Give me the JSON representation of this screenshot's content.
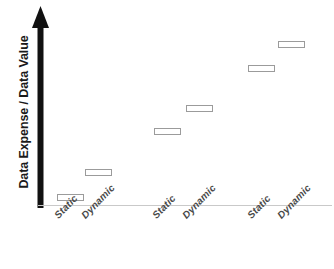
{
  "chart_data": {
    "type": "scatter",
    "title": "",
    "subtitle": "",
    "xlabel": "",
    "ylabel": "Data Expense / Data Value",
    "grid": false,
    "legend": null,
    "marker_style": "hollow-rectangle",
    "axis_style": {
      "y_axis": "thick-black-upward-arrow",
      "x_axis": "thin-light-gray-line",
      "y_ticks": [],
      "x_ticks_rotated_deg": -46
    },
    "note": "Qualitative staircase: six hollow rectangle markers ascending left to right across three groups of Static/Dynamic pairs. No numeric tick labels are printed on either axis.",
    "categories": [
      "Static",
      "Dynamic",
      "Static",
      "Dynamic",
      "Static",
      "Dynamic"
    ],
    "values": [
      1,
      2,
      4,
      5,
      7,
      8
    ],
    "ylim": [
      0,
      9
    ],
    "points": [
      {
        "label": "Static",
        "group": 1,
        "rank": 1,
        "value": 1,
        "x_px": 57,
        "y_px": 194,
        "w_px": 27,
        "h_px": 7
      },
      {
        "label": "Dynamic",
        "group": 1,
        "rank": 2,
        "value": 2,
        "x_px": 85,
        "y_px": 169,
        "w_px": 27,
        "h_px": 7
      },
      {
        "label": "Static",
        "group": 2,
        "rank": 3,
        "value": 4,
        "x_px": 154,
        "y_px": 128,
        "w_px": 27,
        "h_px": 7
      },
      {
        "label": "Dynamic",
        "group": 2,
        "rank": 4,
        "value": 5,
        "x_px": 186,
        "y_px": 105,
        "w_px": 27,
        "h_px": 7
      },
      {
        "label": "Static",
        "group": 3,
        "rank": 5,
        "value": 7,
        "x_px": 248,
        "y_px": 65,
        "w_px": 27,
        "h_px": 7
      },
      {
        "label": "Dynamic",
        "group": 3,
        "rank": 6,
        "value": 8,
        "x_px": 278,
        "y_px": 41,
        "w_px": 27,
        "h_px": 7
      }
    ],
    "tick_labels": [
      {
        "text": "Static",
        "x_px": 52,
        "y_px": 213
      },
      {
        "text": "Dynamic",
        "x_px": 79,
        "y_px": 213
      },
      {
        "text": "Static",
        "x_px": 150,
        "y_px": 213
      },
      {
        "text": "Dynamic",
        "x_px": 180,
        "y_px": 213
      },
      {
        "text": "Static",
        "x_px": 245,
        "y_px": 213
      },
      {
        "text": "Dynamic",
        "x_px": 275,
        "y_px": 213
      }
    ],
    "colors": {
      "axis": "#111111",
      "baseline": "#c9c9c9",
      "marker_stroke": "#9b9b9b",
      "marker_fill": "#ffffff",
      "label_text": "#1a1a1a",
      "tick_text": "#4a4a4a",
      "background": "#ffffff"
    }
  }
}
